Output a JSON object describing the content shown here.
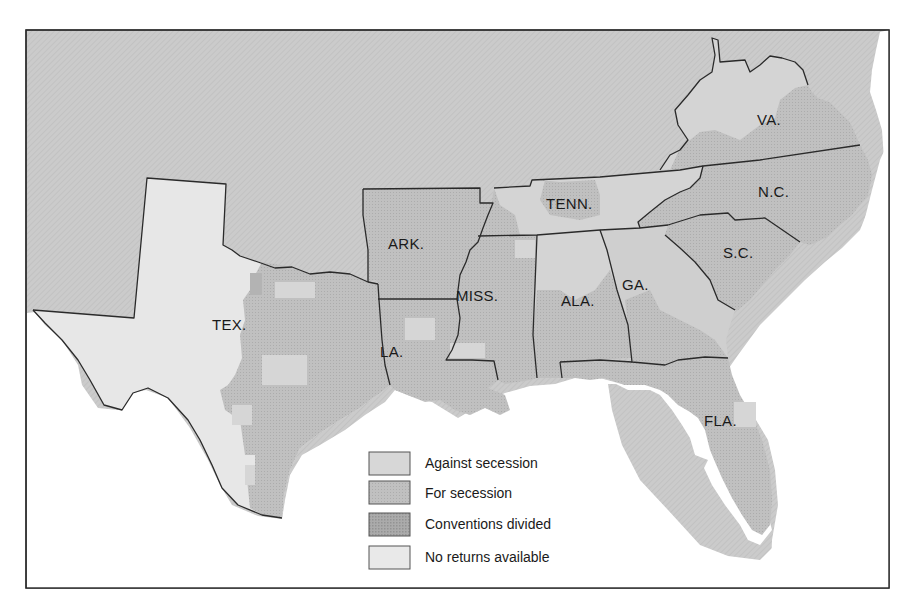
{
  "map": {
    "title": "",
    "colors": {
      "against": "#d7d7d7",
      "for": "#bdbdbd",
      "divided": "#a9a9a9",
      "no_returns": "#e9e9e9",
      "outside": "#c8c8c8",
      "water": "#ffffff",
      "border": "#2a2a2a"
    },
    "states": [
      {
        "abbr": "TEX.",
        "x": 212,
        "y": 330
      },
      {
        "abbr": "ARK.",
        "x": 388,
        "y": 249
      },
      {
        "abbr": "LA.",
        "x": 380,
        "y": 357
      },
      {
        "abbr": "MISS.",
        "x": 456,
        "y": 301
      },
      {
        "abbr": "ALA.",
        "x": 561,
        "y": 306
      },
      {
        "abbr": "TENN.",
        "x": 546,
        "y": 209
      },
      {
        "abbr": "GA.",
        "x": 622,
        "y": 290
      },
      {
        "abbr": "S.C.",
        "x": 723,
        "y": 258
      },
      {
        "abbr": "N.C.",
        "x": 758,
        "y": 197
      },
      {
        "abbr": "VA.",
        "x": 757,
        "y": 125
      },
      {
        "abbr": "FLA.",
        "x": 704,
        "y": 426
      }
    ]
  },
  "legend": {
    "items": [
      {
        "label": "Against secession",
        "swatch": "#d7d7d7"
      },
      {
        "label": "For secession",
        "swatch": "#bdbdbd"
      },
      {
        "label": "Conventions divided",
        "swatch": "#a9a9a9"
      },
      {
        "label": "No returns available",
        "swatch": "#e9e9e9"
      }
    ]
  }
}
